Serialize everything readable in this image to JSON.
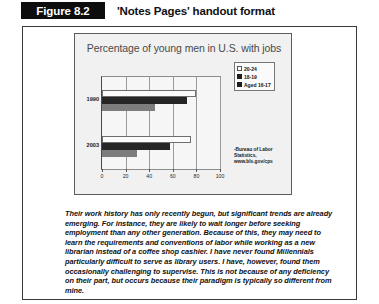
{
  "figure": {
    "tag": "Figure 8.2",
    "caption": "'Notes Pages' handout format"
  },
  "chart_data": {
    "type": "bar",
    "orientation": "horizontal",
    "title": "Percentage of young men in U.S. with jobs",
    "xlabel": "",
    "ylabel": "",
    "categories": [
      "1990",
      "2003"
    ],
    "xlim": [
      0,
      100
    ],
    "xticks": [
      0,
      20,
      40,
      60,
      80,
      100
    ],
    "xtick_labels": [
      "0",
      "20",
      "40",
      "60",
      "80",
      "100"
    ],
    "grid": true,
    "legend_position": "right",
    "series": [
      {
        "name": "20-24",
        "values": [
          80,
          75
        ],
        "color": "#fbfbfb"
      },
      {
        "name": "18-19",
        "values": [
          72,
          58
        ],
        "color": "#262626"
      },
      {
        "name": "Aged 16-17",
        "values": [
          45,
          30
        ],
        "color": "#7d7d7d"
      }
    ],
    "source": "-Bureau of Labor Statistics, www.bls.gov/cps"
  },
  "notes": {
    "paragraph": "Their work history has only recently begun, but significant trends are already emerging.  For instance, they are likely to wait longer before seeking employment than any other generation.  Because of this, they may need to learn the requirements and conventions of labor while working as a new librarian instead of a coffee shop cashier.  I have never found Millennials particularly difficult to serve as library users.  I have, however, found them occasionally challenging to supervise. This is not because of any deficiency on their part, but occurs because their paradigm is typically so different from mine."
  }
}
